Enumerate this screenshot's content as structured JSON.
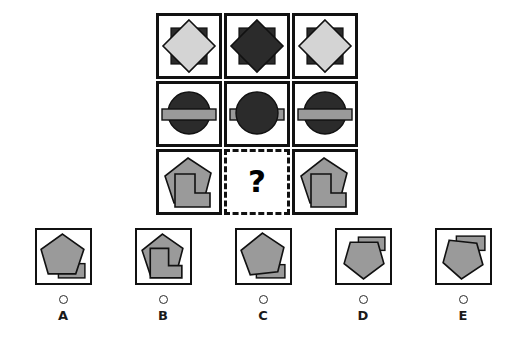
{
  "puzzle": {
    "type": "visual-analogy-matrix",
    "rows": 3,
    "columns": 3,
    "missing_cell": {
      "row": 3,
      "column": 2,
      "marker": "?"
    },
    "palette": {
      "outline": "#111111",
      "dark_fill": "#2b2b2b",
      "light_fill": "#d4d4d4",
      "mid_gray_fill": "#9a9a9a",
      "background": "#ffffff"
    },
    "cells": [
      {
        "id": "r1c1",
        "row": 1,
        "column": 1,
        "description": "dark square with light gray diamond on top",
        "shapes": [
          {
            "name": "square",
            "fill": "#2b2b2b"
          },
          {
            "name": "diamond",
            "fill": "#d4d4d4",
            "on_top": true
          }
        ]
      },
      {
        "id": "r1c2",
        "row": 1,
        "column": 2,
        "description": "dark square with dark diamond on top, same color blend",
        "shapes": [
          {
            "name": "square",
            "fill": "#2b2b2b"
          },
          {
            "name": "diamond",
            "fill": "#2b2b2b",
            "on_top": true
          }
        ]
      },
      {
        "id": "r1c3",
        "row": 1,
        "column": 3,
        "description": "dark square with light gray diamond on top",
        "shapes": [
          {
            "name": "square",
            "fill": "#2b2b2b"
          },
          {
            "name": "diamond",
            "fill": "#d4d4d4",
            "on_top": true
          }
        ]
      },
      {
        "id": "r2c1",
        "row": 2,
        "column": 1,
        "description": "dark circle with light gray horizontal bar on top",
        "shapes": [
          {
            "name": "circle",
            "fill": "#2b2b2b"
          },
          {
            "name": "bar",
            "fill": "#9a9a9a",
            "on_top": true
          }
        ]
      },
      {
        "id": "r2c2",
        "row": 2,
        "column": 2,
        "description": "dark circle with bar behind, only bar ends visible",
        "shapes": [
          {
            "name": "bar",
            "fill": "#9a9a9a"
          },
          {
            "name": "circle",
            "fill": "#2b2b2b",
            "on_top": true
          }
        ]
      },
      {
        "id": "r2c3",
        "row": 2,
        "column": 3,
        "description": "dark circle with light gray horizontal bar on top",
        "shapes": [
          {
            "name": "circle",
            "fill": "#2b2b2b"
          },
          {
            "name": "bar",
            "fill": "#9a9a9a",
            "on_top": true
          }
        ]
      },
      {
        "id": "r3c1",
        "row": 3,
        "column": 1,
        "description": "gray tilted pentagon with gray L-shape on top",
        "shapes": [
          {
            "name": "pentagon",
            "fill": "#9a9a9a"
          },
          {
            "name": "l-shape",
            "fill": "#9a9a9a",
            "on_top": true
          }
        ]
      },
      {
        "id": "r3c2",
        "row": 3,
        "column": 2,
        "description": "missing cell with question mark",
        "shapes": []
      },
      {
        "id": "r3c3",
        "row": 3,
        "column": 3,
        "description": "gray tilted pentagon with gray L-shape on top",
        "shapes": [
          {
            "name": "pentagon",
            "fill": "#9a9a9a"
          },
          {
            "name": "l-shape",
            "fill": "#9a9a9a",
            "on_top": true
          }
        ]
      }
    ]
  },
  "options": [
    {
      "letter": "A",
      "description": "upright pentagon with small rectangle bar behind at bottom right",
      "selected": false
    },
    {
      "letter": "B",
      "description": "tilted pentagon with gray L-shape on top at lower right",
      "selected": false
    },
    {
      "letter": "C",
      "description": "upright pentagon with rectangle bar behind at bottom right",
      "selected": false
    },
    {
      "letter": "D",
      "description": "downward pentagon with rectangle bar at top right",
      "selected": false
    },
    {
      "letter": "E",
      "description": "downward pentagon with rectangle bar at top right overlapping",
      "selected": false
    }
  ]
}
